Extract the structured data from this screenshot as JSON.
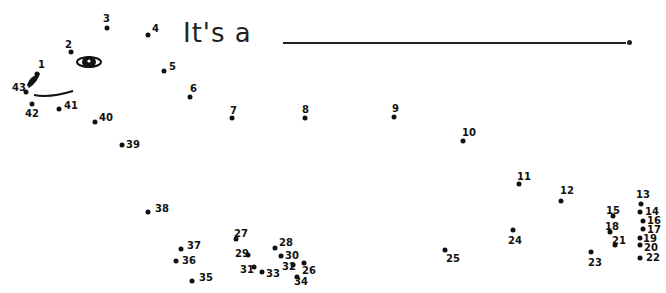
{
  "worksheet": {
    "title_prefix": "It's a",
    "answer_blank": "",
    "period": "."
  },
  "dots": [
    {
      "n": "1",
      "x": 37,
      "y": 74,
      "lx": 38,
      "ly": 60
    },
    {
      "n": "2",
      "x": 71,
      "y": 52,
      "lx": 65,
      "ly": 40
    },
    {
      "n": "3",
      "x": 107,
      "y": 28,
      "lx": 103,
      "ly": 14
    },
    {
      "n": "4",
      "x": 148,
      "y": 35,
      "lx": 152,
      "ly": 24
    },
    {
      "n": "5",
      "x": 164,
      "y": 71,
      "lx": 169,
      "ly": 62
    },
    {
      "n": "6",
      "x": 190,
      "y": 97,
      "lx": 190,
      "ly": 84
    },
    {
      "n": "7",
      "x": 232,
      "y": 118,
      "lx": 230,
      "ly": 106
    },
    {
      "n": "8",
      "x": 305,
      "y": 118,
      "lx": 302,
      "ly": 105
    },
    {
      "n": "9",
      "x": 394,
      "y": 117,
      "lx": 392,
      "ly": 104
    },
    {
      "n": "10",
      "x": 463,
      "y": 141,
      "lx": 462,
      "ly": 128
    },
    {
      "n": "11",
      "x": 519,
      "y": 184,
      "lx": 517,
      "ly": 172
    },
    {
      "n": "12",
      "x": 561,
      "y": 201,
      "lx": 560,
      "ly": 186
    },
    {
      "n": "13",
      "x": 641,
      "y": 204,
      "lx": 636,
      "ly": 190
    },
    {
      "n": "14",
      "x": 640,
      "y": 212,
      "lx": 645,
      "ly": 207
    },
    {
      "n": "15",
      "x": 613,
      "y": 216,
      "lx": 606,
      "ly": 206
    },
    {
      "n": "16",
      "x": 643,
      "y": 221,
      "lx": 647,
      "ly": 216
    },
    {
      "n": "17",
      "x": 643,
      "y": 229,
      "lx": 647,
      "ly": 225
    },
    {
      "n": "18",
      "x": 610,
      "y": 232,
      "lx": 605,
      "ly": 222
    },
    {
      "n": "19",
      "x": 640,
      "y": 238,
      "lx": 643,
      "ly": 234
    },
    {
      "n": "20",
      "x": 640,
      "y": 245,
      "lx": 644,
      "ly": 243
    },
    {
      "n": "21",
      "x": 615,
      "y": 245,
      "lx": 612,
      "ly": 236
    },
    {
      "n": "22",
      "x": 640,
      "y": 258,
      "lx": 646,
      "ly": 253
    },
    {
      "n": "23",
      "x": 591,
      "y": 252,
      "lx": 588,
      "ly": 258
    },
    {
      "n": "24",
      "x": 513,
      "y": 230,
      "lx": 508,
      "ly": 236
    },
    {
      "n": "25",
      "x": 445,
      "y": 250,
      "lx": 446,
      "ly": 254
    },
    {
      "n": "26",
      "x": 304,
      "y": 263,
      "lx": 302,
      "ly": 266
    },
    {
      "n": "27",
      "x": 236,
      "y": 239,
      "lx": 234,
      "ly": 229
    },
    {
      "n": "28",
      "x": 275,
      "y": 248,
      "lx": 279,
      "ly": 238
    },
    {
      "n": "29",
      "x": 248,
      "y": 255,
      "lx": 235,
      "ly": 249
    },
    {
      "n": "30",
      "x": 281,
      "y": 256,
      "lx": 285,
      "ly": 251
    },
    {
      "n": "31",
      "x": 254,
      "y": 267,
      "lx": 240,
      "ly": 265
    },
    {
      "n": "32",
      "x": 293,
      "y": 265,
      "lx": 282,
      "ly": 262
    },
    {
      "n": "33",
      "x": 262,
      "y": 272,
      "lx": 266,
      "ly": 269
    },
    {
      "n": "34",
      "x": 297,
      "y": 277,
      "lx": 294,
      "ly": 277
    },
    {
      "n": "35",
      "x": 192,
      "y": 281,
      "lx": 199,
      "ly": 273
    },
    {
      "n": "36",
      "x": 176,
      "y": 261,
      "lx": 182,
      "ly": 256
    },
    {
      "n": "37",
      "x": 181,
      "y": 249,
      "lx": 187,
      "ly": 241
    },
    {
      "n": "38",
      "x": 148,
      "y": 212,
      "lx": 155,
      "ly": 204
    },
    {
      "n": "39",
      "x": 122,
      "y": 145,
      "lx": 126,
      "ly": 140
    },
    {
      "n": "40",
      "x": 95,
      "y": 122,
      "lx": 99,
      "ly": 113
    },
    {
      "n": "41",
      "x": 59,
      "y": 109,
      "lx": 64,
      "ly": 101
    },
    {
      "n": "42",
      "x": 32,
      "y": 104,
      "lx": 25,
      "ly": 109
    },
    {
      "n": "43",
      "x": 26,
      "y": 92,
      "lx": 12,
      "ly": 83
    }
  ],
  "decorations": {
    "eye": "eye-shape",
    "nose": "nose-shape",
    "mouth": "mouth-curve"
  }
}
